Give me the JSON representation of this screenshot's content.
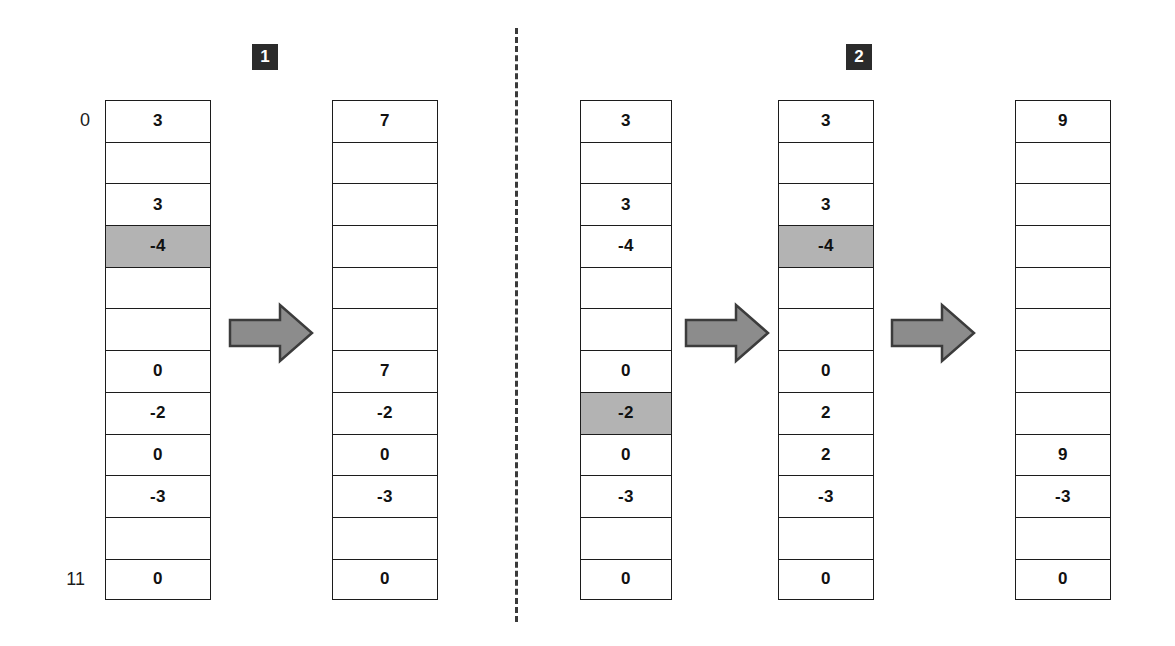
{
  "figure": {
    "type": "array-transformation-diagram",
    "highlight_color": "#b3b3b3",
    "arrow_color": "#8c8c8c",
    "arrow_border_color": "#3c3c3c",
    "badge_color": "#2b2b2b",
    "line_color": "#1c1c1c"
  },
  "index_labels": {
    "first": "0",
    "last": "11"
  },
  "steps": [
    {
      "id": "step-1",
      "label": "1"
    },
    {
      "id": "step-2",
      "label": "2"
    }
  ],
  "arrays": [
    {
      "name": "array-1",
      "cells": [
        {
          "value": "3",
          "highlighted": false
        },
        {
          "value": "",
          "highlighted": false
        },
        {
          "value": "3",
          "highlighted": false
        },
        {
          "value": "-4",
          "highlighted": true
        },
        {
          "value": "",
          "highlighted": false
        },
        {
          "value": "",
          "highlighted": false
        },
        {
          "value": "0",
          "highlighted": false
        },
        {
          "value": "-2",
          "highlighted": false
        },
        {
          "value": "0",
          "highlighted": false
        },
        {
          "value": "-3",
          "highlighted": false
        },
        {
          "value": "",
          "highlighted": false
        },
        {
          "value": "0",
          "highlighted": false
        }
      ]
    },
    {
      "name": "array-2",
      "cells": [
        {
          "value": "7",
          "highlighted": false
        },
        {
          "value": "",
          "highlighted": false
        },
        {
          "value": "",
          "highlighted": false
        },
        {
          "value": "",
          "highlighted": false
        },
        {
          "value": "",
          "highlighted": false
        },
        {
          "value": "",
          "highlighted": false
        },
        {
          "value": "7",
          "highlighted": false
        },
        {
          "value": "-2",
          "highlighted": false
        },
        {
          "value": "0",
          "highlighted": false
        },
        {
          "value": "-3",
          "highlighted": false
        },
        {
          "value": "",
          "highlighted": false
        },
        {
          "value": "0",
          "highlighted": false
        }
      ]
    },
    {
      "name": "array-3",
      "cells": [
        {
          "value": "3",
          "highlighted": false
        },
        {
          "value": "",
          "highlighted": false
        },
        {
          "value": "3",
          "highlighted": false
        },
        {
          "value": "-4",
          "highlighted": false
        },
        {
          "value": "",
          "highlighted": false
        },
        {
          "value": "",
          "highlighted": false
        },
        {
          "value": "0",
          "highlighted": false
        },
        {
          "value": "-2",
          "highlighted": true
        },
        {
          "value": "0",
          "highlighted": false
        },
        {
          "value": "-3",
          "highlighted": false
        },
        {
          "value": "",
          "highlighted": false
        },
        {
          "value": "0",
          "highlighted": false
        }
      ]
    },
    {
      "name": "array-4",
      "cells": [
        {
          "value": "3",
          "highlighted": false
        },
        {
          "value": "",
          "highlighted": false
        },
        {
          "value": "3",
          "highlighted": false
        },
        {
          "value": "-4",
          "highlighted": true
        },
        {
          "value": "",
          "highlighted": false
        },
        {
          "value": "",
          "highlighted": false
        },
        {
          "value": "0",
          "highlighted": false
        },
        {
          "value": "2",
          "highlighted": false
        },
        {
          "value": "2",
          "highlighted": false
        },
        {
          "value": "-3",
          "highlighted": false
        },
        {
          "value": "",
          "highlighted": false
        },
        {
          "value": "0",
          "highlighted": false
        }
      ]
    },
    {
      "name": "array-5",
      "cells": [
        {
          "value": "9",
          "highlighted": false
        },
        {
          "value": "",
          "highlighted": false
        },
        {
          "value": "",
          "highlighted": false
        },
        {
          "value": "",
          "highlighted": false
        },
        {
          "value": "",
          "highlighted": false
        },
        {
          "value": "",
          "highlighted": false
        },
        {
          "value": "",
          "highlighted": false
        },
        {
          "value": "",
          "highlighted": false
        },
        {
          "value": "9",
          "highlighted": false
        },
        {
          "value": "-3",
          "highlighted": false
        },
        {
          "value": "",
          "highlighted": false
        },
        {
          "value": "0",
          "highlighted": false
        }
      ]
    }
  ],
  "arrows": [
    {
      "name": "arrow-1"
    },
    {
      "name": "arrow-2"
    },
    {
      "name": "arrow-3"
    }
  ],
  "layout": {
    "array_left": [
      105,
      332,
      580,
      778,
      1015
    ],
    "array_width": [
      106,
      106,
      92,
      96,
      96
    ],
    "table_top": 100,
    "row_height": 41.7,
    "rows": 12,
    "divider_x": 515,
    "divider_top": 28,
    "divider_bottom": 622,
    "badge_positions": [
      [
        252,
        44
      ],
      [
        846,
        44
      ]
    ],
    "arrow_positions": [
      [
        228,
        310
      ],
      [
        905,
        310
      ],
      [
        231,
        310
      ]
    ]
  }
}
